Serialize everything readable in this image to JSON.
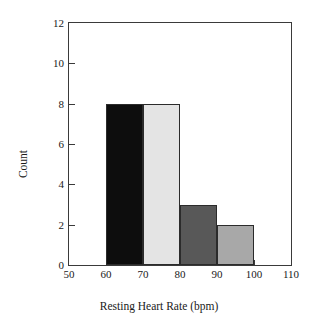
{
  "chart_data": {
    "type": "bar",
    "subtype": "histogram",
    "title": "",
    "xlabel": "Resting Heart Rate (bpm)",
    "ylabel": "Count",
    "xlim": [
      50,
      110
    ],
    "ylim": [
      0,
      12
    ],
    "xticks": [
      50,
      60,
      70,
      80,
      90,
      100,
      110
    ],
    "xtick_labels": [
      "50",
      "60",
      "70",
      "80",
      "90",
      "100",
      "110"
    ],
    "yticks": [
      0,
      2,
      4,
      6,
      8,
      10,
      12
    ],
    "ytick_labels": [
      "0",
      "2",
      "4",
      "6",
      "8",
      "10",
      "12"
    ],
    "grid": false,
    "legend": null,
    "bin_width": 10,
    "categories": [
      "60-70",
      "70-80",
      "80-90",
      "90-100"
    ],
    "values": [
      8,
      8,
      3,
      2
    ],
    "bins": [
      {
        "label": "60-70",
        "x0": 60,
        "x1": 70,
        "value": 8,
        "color": "#0d0d0d"
      },
      {
        "label": "70-80",
        "x0": 70,
        "x1": 80,
        "value": 8,
        "color": "#e4e4e4"
      },
      {
        "label": "80-90",
        "x0": 80,
        "x1": 90,
        "value": 3,
        "color": "#585858"
      },
      {
        "label": "90-100",
        "x0": 90,
        "x1": 100,
        "value": 2,
        "color": "#a8a8a8"
      }
    ],
    "bar_edge_color": "#2b2b2b",
    "axis_color": "#3a3a3a",
    "background": "#ffffff"
  }
}
